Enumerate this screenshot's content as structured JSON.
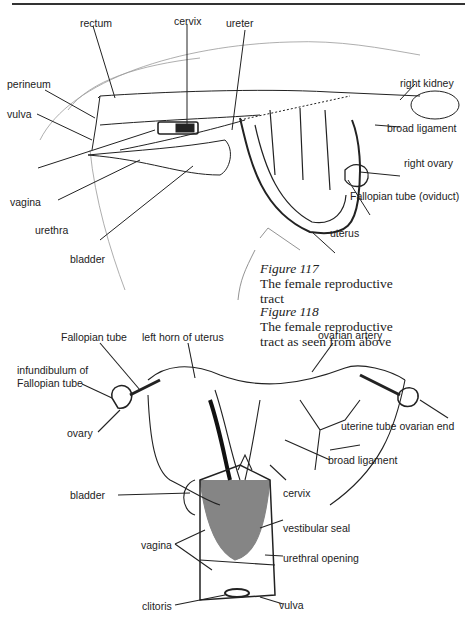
{
  "figure117": {
    "caption_number": "Figure 117",
    "caption_text": "The female reproductive tract",
    "labels": {
      "rectum": "rectum",
      "cervix": "cervix",
      "ureter": "ureter",
      "perineum": "perineum",
      "vulva": "vulva",
      "right_kidney": "right kidney",
      "broad_ligament": "broad ligament",
      "right_ovary": "right ovary",
      "fallopian_tube": "Fallopian tube (oviduct)",
      "vagina": "vagina",
      "urethra": "urethra",
      "bladder": "bladder",
      "uterus": "uterus"
    }
  },
  "figure118": {
    "caption_number": "Figure 118",
    "caption_text": "The female reproductive tract as seen from above",
    "labels": {
      "fallopian_tube": "Fallopian tube",
      "left_horn": "left horn of uterus",
      "ovarian_artery": "ovarian artery",
      "infundibulum_line1": "infundibulum of",
      "infundibulum_line2": "Fallopian tube",
      "ovary": "ovary",
      "uterine_tube_end": "uterine tube ovarian end",
      "broad_ligament": "broad ligament",
      "bladder": "bladder",
      "cervix": "cervix",
      "vestibular_seal": "vestibular seal",
      "vagina": "vagina",
      "urethral_opening": "urethral opening",
      "clitoris": "clitoris",
      "vulva": "vulva"
    }
  }
}
